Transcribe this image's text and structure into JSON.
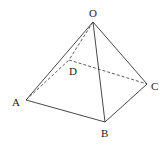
{
  "diagram": {
    "type": "pyramid",
    "vertices": {
      "O": {
        "label": "O",
        "x": 93,
        "y": 22
      },
      "A": {
        "label": "A",
        "x": 26,
        "y": 100
      },
      "B": {
        "label": "B",
        "x": 105,
        "y": 122
      },
      "C": {
        "label": "C",
        "x": 147,
        "y": 84
      },
      "D": {
        "label": "D",
        "x": 69,
        "y": 60
      }
    },
    "visible_edges": [
      "OA",
      "OB",
      "OC",
      "AB",
      "BC"
    ],
    "hidden_edges": [
      "OD",
      "AD",
      "DC"
    ],
    "colors": {
      "line": "#333333",
      "background": "#ffffff"
    }
  }
}
